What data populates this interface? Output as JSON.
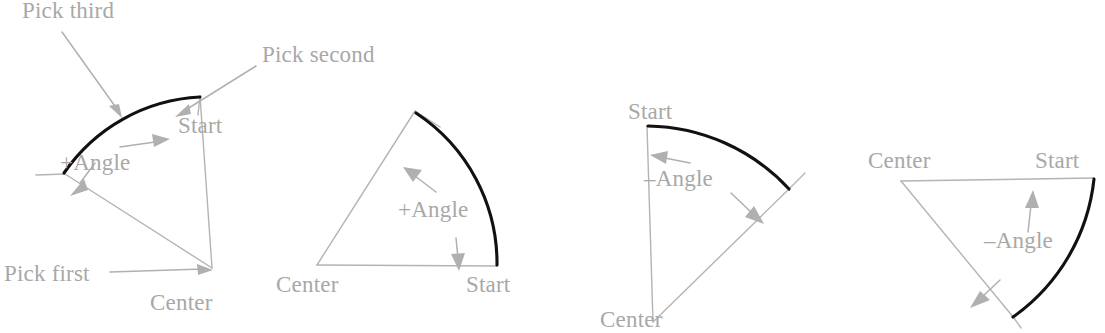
{
  "figure": {
    "canvas": {
      "width": 1105,
      "height": 333
    },
    "colors": {
      "background": "#ffffff",
      "arc": "#111111",
      "construction_line": "#b4b4b4",
      "leader_line": "#b0b0b0",
      "arrow": "#b0b0b0",
      "label_text": "#a8a8a8"
    },
    "panels": [
      {
        "id": "panel-1",
        "name": "three-pick-positive-angle",
        "angle_sign": "+",
        "angle_label": "+Angle",
        "labels": [
          {
            "name": "pick-third",
            "text": "Pick third",
            "x": 22,
            "y": 18,
            "anchor": "start"
          },
          {
            "name": "pick-second",
            "text": "Pick second",
            "x": 262,
            "y": 62,
            "anchor": "start"
          },
          {
            "name": "start",
            "text": "Start",
            "x": 178,
            "y": 133,
            "anchor": "start"
          },
          {
            "name": "angle",
            "text": "+Angle",
            "x": 60,
            "y": 170,
            "anchor": "start"
          },
          {
            "name": "pick-first",
            "text": "Pick first",
            "x": 4,
            "y": 281,
            "anchor": "start"
          },
          {
            "name": "center",
            "text": "Center",
            "x": 150,
            "y": 310,
            "anchor": "start"
          }
        ],
        "geometry": {
          "center": [
            212,
            268
          ],
          "radius": 175,
          "start_angle_deg": 94,
          "end_angle_deg": 147
        }
      },
      {
        "id": "panel-2",
        "name": "center-start-positive-angle",
        "angle_sign": "+",
        "angle_label": "+Angle",
        "labels": [
          {
            "name": "angle",
            "text": "+Angle",
            "x": 398,
            "y": 217,
            "anchor": "start"
          },
          {
            "name": "center",
            "text": "Center",
            "x": 276,
            "y": 292,
            "anchor": "start"
          },
          {
            "name": "start",
            "text": "Start",
            "x": 466,
            "y": 292,
            "anchor": "start"
          }
        ],
        "geometry": {
          "center": [
            317,
            265
          ],
          "radius": 180,
          "start_angle_deg": 0,
          "end_angle_deg": 57
        }
      },
      {
        "id": "panel-3",
        "name": "center-start-negative-angle",
        "angle_sign": "-",
        "angle_label": "–Angle",
        "labels": [
          {
            "name": "start",
            "text": "Start",
            "x": 628,
            "y": 119,
            "anchor": "start"
          },
          {
            "name": "angle",
            "text": "–Angle",
            "x": 644,
            "y": 186,
            "anchor": "start"
          },
          {
            "name": "center",
            "text": "Center",
            "x": 600,
            "y": 327,
            "anchor": "start"
          }
        ],
        "geometry": {
          "center": [
            653,
            322
          ],
          "radius": 196,
          "start_angle_deg": 90,
          "end_angle_deg": 40
        }
      },
      {
        "id": "panel-4",
        "name": "center-start-negative-angle-flat",
        "angle_sign": "-",
        "angle_label": "–Angle",
        "labels": [
          {
            "name": "center",
            "text": "Center",
            "x": 868,
            "y": 168,
            "anchor": "start"
          },
          {
            "name": "start",
            "text": "Start",
            "x": 1035,
            "y": 168,
            "anchor": "start"
          },
          {
            "name": "angle",
            "text": "–Angle",
            "x": 984,
            "y": 248,
            "anchor": "start"
          }
        ],
        "geometry": {
          "center": [
            901,
            180
          ],
          "radius": 194,
          "start_angle_deg": 0,
          "end_angle_deg": -44
        }
      }
    ],
    "annotations": {
      "arrowheads_count": 10,
      "leader_lines_count": 3
    }
  }
}
